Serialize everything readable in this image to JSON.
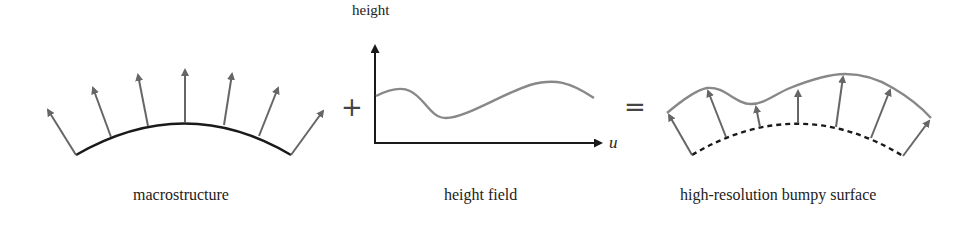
{
  "panels": {
    "macrostructure": {
      "caption": "macrostructure"
    },
    "height_field": {
      "caption": "height field",
      "y_axis_label": "height",
      "x_axis_label": "u"
    },
    "bumpy_surface": {
      "caption": "high-resolution bumpy surface"
    }
  },
  "operators": {
    "plus": "+",
    "equals": "="
  },
  "colors": {
    "macro_curve": "#1a1a1a",
    "arrow": "#666666",
    "height_curve": "#888888",
    "axis": "#1a1a1a"
  }
}
